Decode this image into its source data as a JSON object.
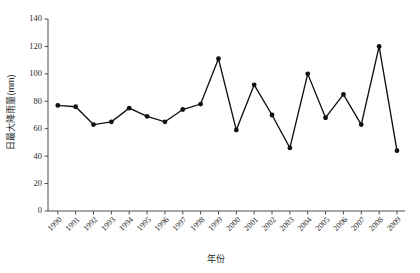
{
  "chart_data": {
    "type": "line",
    "title": "",
    "xlabel": "年份",
    "ylabel": "日最大降雨量(mm)",
    "categories": [
      "1990",
      "1991",
      "1992",
      "1993",
      "1994",
      "1995",
      "1996",
      "1997",
      "1998",
      "1999",
      "2000",
      "2001",
      "2002",
      "2003",
      "2004",
      "2005",
      "2006",
      "2007",
      "2008",
      "2009"
    ],
    "values": [
      77,
      76,
      63,
      65,
      75,
      69,
      65,
      74,
      78,
      111,
      59,
      92,
      70,
      46,
      100,
      68,
      85,
      63,
      120,
      44
    ],
    "series": [
      {
        "name": "日最大降雨量",
        "values": [
          77,
          76,
          63,
          65,
          75,
          69,
          65,
          74,
          78,
          111,
          59,
          92,
          70,
          46,
          100,
          68,
          85,
          63,
          120,
          44
        ]
      }
    ],
    "ylim": [
      0,
      140
    ],
    "yticks": [
      0,
      20,
      40,
      60,
      80,
      100,
      120,
      140
    ],
    "ytick_labels": [
      "0",
      "20",
      "40",
      "60",
      "80",
      "100",
      "120",
      "140"
    ],
    "xtick_labels": [
      "1990",
      "1991",
      "1992",
      "1993",
      "1994",
      "1995",
      "1996",
      "1997",
      "1998",
      "1999",
      "2000",
      "2001",
      "2002",
      "2003",
      "2004",
      "2005",
      "2006",
      "2007",
      "2008",
      "2009"
    ],
    "grid": false,
    "legend": false,
    "legend_position": "none",
    "marker": "filled-circle",
    "line_color": "#111111",
    "marker_color": "#111111",
    "axis_color": "#4d4d4d",
    "background": "#ffffff",
    "xtick_rotation": -45
  },
  "labels": {
    "y_axis_title": "日最大降雨量(mm)",
    "x_axis_title": "年份"
  }
}
